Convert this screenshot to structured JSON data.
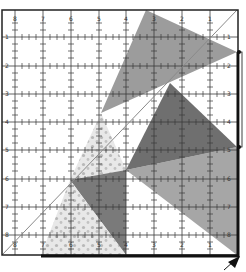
{
  "diagram": {
    "type": "quilt-ruler-cutting-diagram",
    "ruler": {
      "top_labels": [
        "8",
        "7",
        "6",
        "5",
        "4",
        "3",
        "2",
        "1"
      ],
      "left_labels": [
        "1",
        "2",
        "3",
        "4",
        "5",
        "6",
        "7",
        "8"
      ],
      "right_labels": [
        "1",
        "2",
        "3",
        "4",
        "5",
        "6",
        "7",
        "8"
      ],
      "bottom_labels": [
        "8",
        "7",
        "6",
        "5",
        "4",
        "3",
        "2",
        "1"
      ],
      "grid_x": [
        15,
        43,
        71,
        99,
        126,
        154,
        182,
        210
      ],
      "grid_y": [
        37,
        66,
        94,
        122,
        150,
        179,
        207,
        235
      ]
    },
    "colors": {
      "background": "#ffffff",
      "frame": "#222222",
      "grid": "#444444",
      "medium_gray": "#9a9a9a",
      "dark_gray": "#6e6e6e",
      "light_gray": "#a8a8a8",
      "dotted_fill": "#e6e6e6",
      "dot": "#b5b5b5",
      "diagonal": "#8a8a8a"
    },
    "shapes": [
      {
        "name": "top-gray-triangle",
        "fill": "medium_gray",
        "points": "146,10 237,52 101,113"
      },
      {
        "name": "right-dark-triangle",
        "fill": "dark_gray",
        "points": "170,83 237,147 126,170"
      },
      {
        "name": "lower-right-gray-triangle",
        "fill": "light_gray",
        "points": "126,170 237,147 237,255"
      },
      {
        "name": "upper-dotted-triangle",
        "fill": "dotted",
        "points": "101,113 126,170 70,180"
      },
      {
        "name": "center-dark-triangle",
        "fill": "dark_gray",
        "points": "70,180 126,170 126,255"
      },
      {
        "name": "lower-dotted-triangle",
        "fill": "dotted",
        "points": "70,180 126,255 41,255"
      }
    ],
    "diagonal_line": {
      "x1": 2,
      "y1": 255,
      "x2": 237,
      "y2": 10
    },
    "arrow_label": "cut-direction-arrow"
  }
}
